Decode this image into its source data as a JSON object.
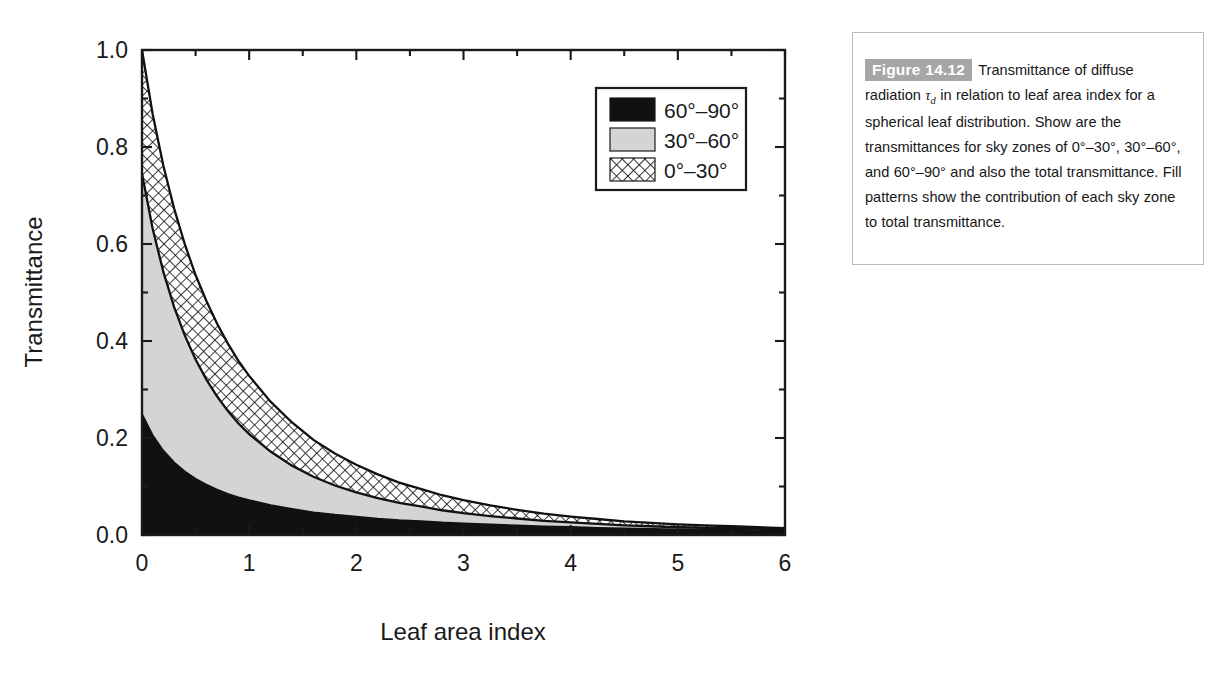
{
  "figure": {
    "tag": "Figure 14.12",
    "caption_part1": "Transmittance of diffuse radiation ",
    "caption_tau": "τ",
    "caption_tau_sub": "d",
    "caption_part2": " in relation to leaf area index for a spherical leaf distribution. Show are the transmittances for sky zones of 0°–30°, 30°–60°, and 60°–90° and also the total transmittance. Fill patterns show the contribution of each sky zone to total transmittance.",
    "caption_full": "Figure 14.12  Transmittance of diffuse radiation τd in relation to leaf area index for a spherical leaf distribution. Show are the transmittances for sky zones of 0°–30°, 30°–60°, and 60°–90° and also the total transmittance. Fill patterns show the contribution of each sky zone to total transmittance."
  },
  "colors": {
    "tag_background": "#a6a6a6",
    "tag_text": "#ffffff",
    "zone_60_90": "#111111",
    "zone_30_60": "#d4d4d4",
    "zone_0_30_line": "#111111",
    "axis": "#1a1a1a",
    "panel_border": "#b9b9b9",
    "page_background": "#ffffff"
  },
  "chart_data": {
    "type": "area",
    "title": "",
    "xlabel": "Leaf area index",
    "ylabel": "Transmittance",
    "xlim": [
      0,
      6
    ],
    "ylim": [
      0,
      1
    ],
    "xticks": [
      0,
      1,
      2,
      3,
      4,
      5,
      6
    ],
    "xticklabels": [
      "0",
      "1",
      "2",
      "3",
      "4",
      "5",
      "6"
    ],
    "xminorticks": [
      0.5,
      1.5,
      2.5,
      3.5,
      4.5,
      5.5
    ],
    "yticks": [
      0.0,
      0.2,
      0.4,
      0.6,
      0.8,
      1.0
    ],
    "yticklabels": [
      "0.0",
      "0.2",
      "0.4",
      "0.6",
      "0.8",
      "1.0"
    ],
    "yminorticks": [
      0.1,
      0.3,
      0.5,
      0.7,
      0.9
    ],
    "grid": false,
    "frame": "box",
    "stacked": true,
    "legend_position": "upper right",
    "x": [
      0,
      0.1,
      0.2,
      0.3,
      0.4,
      0.5,
      0.6,
      0.7,
      0.8,
      0.9,
      1.0,
      1.2,
      1.4,
      1.6,
      1.8,
      2.0,
      2.2,
      2.4,
      2.6,
      2.8,
      3.0,
      3.25,
      3.5,
      3.75,
      4.0,
      4.25,
      4.5,
      4.75,
      5.0,
      5.25,
      5.5,
      5.75,
      6.0
    ],
    "series": [
      {
        "name": "60°–90°",
        "fill": "solid-black",
        "color": "#111111",
        "stack_order": 1,
        "values": [
          0.25,
          0.206,
          0.174,
          0.15,
          0.131,
          0.116,
          0.104,
          0.094,
          0.085,
          0.078,
          0.072,
          0.062,
          0.054,
          0.047,
          0.042,
          0.038,
          0.034,
          0.031,
          0.029,
          0.026,
          0.024,
          0.022,
          0.02,
          0.018,
          0.017,
          0.015,
          0.014,
          0.013,
          0.012,
          0.011,
          0.011,
          0.01,
          0.009
        ]
      },
      {
        "name": "30°–60°",
        "fill": "light-gray",
        "color": "#d4d4d4",
        "stack_order": 2,
        "values": [
          0.495,
          0.425,
          0.368,
          0.32,
          0.28,
          0.246,
          0.217,
          0.192,
          0.171,
          0.152,
          0.136,
          0.11,
          0.089,
          0.073,
          0.06,
          0.05,
          0.042,
          0.035,
          0.03,
          0.025,
          0.021,
          0.017,
          0.014,
          0.011,
          0.009,
          0.008,
          0.006,
          0.005,
          0.004,
          0.004,
          0.003,
          0.003,
          0.002
        ]
      },
      {
        "name": "0°–30°",
        "fill": "crosshatch",
        "color": "#ffffff",
        "stack_order": 3,
        "values": [
          0.255,
          0.236,
          0.219,
          0.203,
          0.188,
          0.174,
          0.162,
          0.15,
          0.139,
          0.129,
          0.12,
          0.103,
          0.089,
          0.076,
          0.066,
          0.057,
          0.049,
          0.042,
          0.036,
          0.031,
          0.027,
          0.022,
          0.018,
          0.015,
          0.012,
          0.01,
          0.008,
          0.007,
          0.006,
          0.005,
          0.004,
          0.003,
          0.003
        ]
      }
    ],
    "cumulative": {
      "top_of_black": [
        0.25,
        0.206,
        0.174,
        0.15,
        0.131,
        0.116,
        0.104,
        0.094,
        0.085,
        0.078,
        0.072,
        0.062,
        0.054,
        0.047,
        0.042,
        0.038,
        0.034,
        0.031,
        0.029,
        0.026,
        0.024,
        0.022,
        0.02,
        0.018,
        0.017,
        0.015,
        0.014,
        0.013,
        0.012,
        0.011,
        0.011,
        0.01,
        0.009
      ],
      "top_of_gray": [
        0.745,
        0.631,
        0.542,
        0.47,
        0.411,
        0.362,
        0.321,
        0.286,
        0.256,
        0.23,
        0.208,
        0.172,
        0.143,
        0.12,
        0.102,
        0.088,
        0.076,
        0.066,
        0.059,
        0.051,
        0.045,
        0.039,
        0.034,
        0.029,
        0.026,
        0.023,
        0.02,
        0.018,
        0.016,
        0.015,
        0.014,
        0.013,
        0.011
      ],
      "total": [
        1.0,
        0.867,
        0.761,
        0.673,
        0.599,
        0.536,
        0.483,
        0.436,
        0.395,
        0.359,
        0.328,
        0.275,
        0.232,
        0.196,
        0.168,
        0.145,
        0.125,
        0.108,
        0.095,
        0.082,
        0.072,
        0.061,
        0.052,
        0.044,
        0.038,
        0.033,
        0.028,
        0.025,
        0.022,
        0.02,
        0.018,
        0.016,
        0.014
      ]
    },
    "annotations": []
  },
  "legend": {
    "position": "upper-right",
    "items": [
      {
        "label": "60°–90°",
        "swatch": "solid-black"
      },
      {
        "label": "30°–60°",
        "swatch": "light-gray"
      },
      {
        "label": "0°–30°",
        "swatch": "crosshatch"
      }
    ]
  },
  "axes": {
    "x_label": "Leaf area index",
    "y_label": "Transmittance"
  }
}
